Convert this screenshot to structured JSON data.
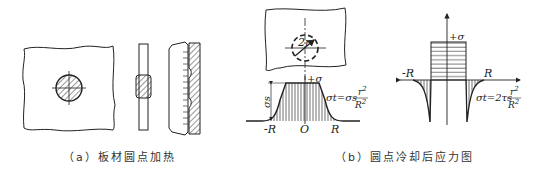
{
  "figure_a": {
    "caption": "（a）板材圆点加热",
    "parts": [
      "plate-with-heated-spot",
      "side-section-heated",
      "side-section-after-upsetting"
    ]
  },
  "figure_b": {
    "caption": "（b）圆点冷却后应力图",
    "plate_label": "2r",
    "heating_curve": {
      "axis_label_y": "+σ",
      "yield_label": "σs",
      "formula": "σt=σs r²/R²",
      "formula_main": "σt=σs",
      "formula_num": "r",
      "formula_num_exp": "2",
      "formula_den": "R",
      "formula_den_exp": "2",
      "x_labels": [
        "-R",
        "O",
        "R"
      ]
    },
    "cooling_curve": {
      "axis_label_y": "+σ",
      "x_labels": [
        "-R",
        "R"
      ],
      "formula": "σt=2τs r²/R²",
      "formula_main": "σt=2τs",
      "formula_num": "r",
      "formula_num_exp": "2",
      "formula_den": "R",
      "formula_den_exp": "2"
    }
  },
  "colors": {
    "line": "#222222",
    "hatch": "#444444",
    "background": "#ffffff"
  }
}
